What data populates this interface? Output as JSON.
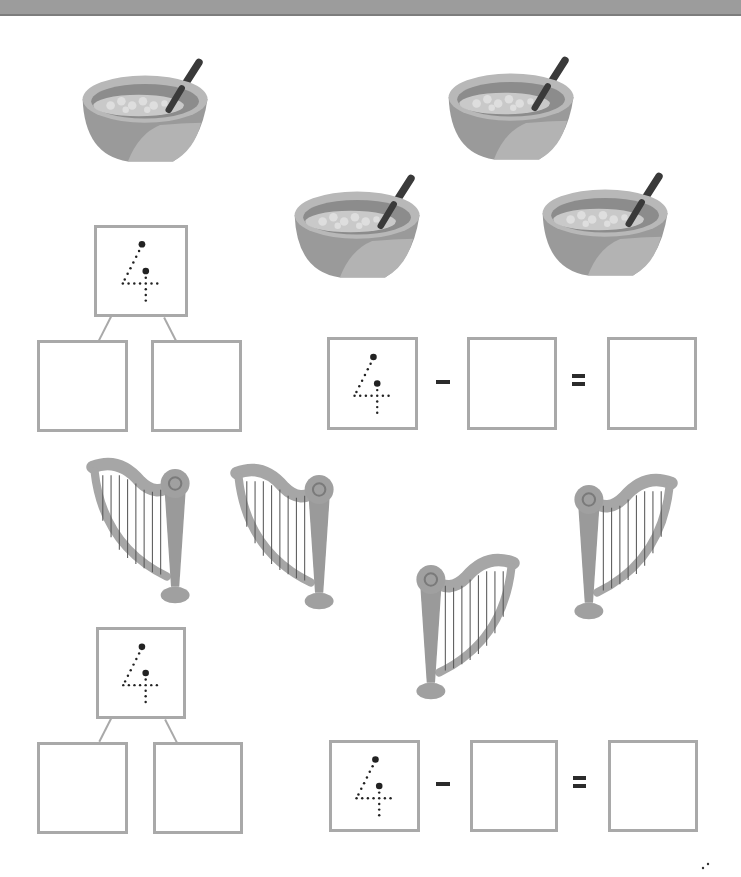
{
  "worksheet": {
    "topic": "number bonds and subtraction to 4",
    "colors": {
      "box_border": "#a9a9a9",
      "header_bar": "#9c9c9c",
      "operator": "#2b2b2b"
    },
    "sections": [
      {
        "name": "bowls",
        "picture": "bowl-of-cereal",
        "picture_count": 4,
        "bond": {
          "whole": "4",
          "part_a": "",
          "part_b": ""
        },
        "equation": {
          "minuend": "4",
          "operator": "−",
          "subtrahend": "",
          "equals": "=",
          "difference": ""
        }
      },
      {
        "name": "harps",
        "picture": "harp",
        "picture_count": 4,
        "bond": {
          "whole": "4",
          "part_a": "",
          "part_b": ""
        },
        "equation": {
          "minuend": "4",
          "operator": "−",
          "subtrahend": "",
          "equals": "=",
          "difference": ""
        }
      }
    ]
  }
}
